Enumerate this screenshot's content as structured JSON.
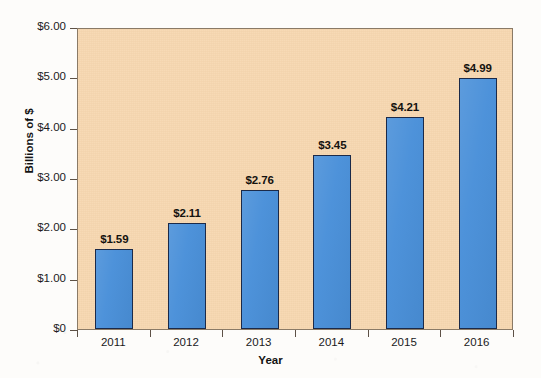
{
  "chart_data": {
    "type": "bar",
    "title": "",
    "subtitle": "",
    "xlabel": "Year",
    "ylabel": "Billions of $",
    "categories": [
      "2011",
      "2012",
      "2013",
      "2014",
      "2015",
      "2016"
    ],
    "values": [
      1.59,
      2.11,
      2.76,
      3.45,
      4.21,
      4.99
    ],
    "data_labels": [
      "$1.59",
      "$2.11",
      "$2.76",
      "$3.45",
      "$4.21",
      "$4.99"
    ],
    "ylim": [
      0,
      6
    ],
    "y_ticks": [
      0,
      1,
      2,
      3,
      4,
      5,
      6
    ],
    "y_tick_labels": [
      "$0",
      "$1.00",
      "$2.00",
      "$3.00",
      "$4.00",
      "$5.00",
      "$6.00"
    ],
    "grid": false,
    "legend": false,
    "legend_position": "none",
    "series": [
      {
        "name": "Billions of $",
        "values": [
          1.59,
          2.11,
          2.76,
          3.45,
          4.21,
          4.99
        ]
      }
    ],
    "colors": {
      "bar_fill": "#4A90D9",
      "bar_border": "#1B2A49",
      "plot_background": "#F7D7B0",
      "page_background": "#FDFCFA",
      "axis_line": "#8A7A66",
      "text": "#1A1A1A"
    }
  }
}
